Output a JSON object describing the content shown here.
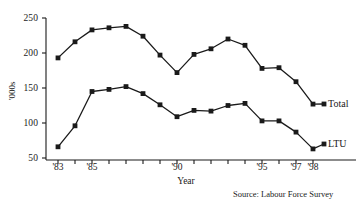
{
  "chart_data": {
    "type": "line",
    "title": "",
    "subtitle": "",
    "xlabel": "Year",
    "ylabel": "'000s",
    "x": [
      1983,
      1984,
      1985,
      1986,
      1987,
      1988,
      1989,
      1990,
      1991,
      1992,
      1993,
      1994,
      1995,
      1996,
      1997,
      1998
    ],
    "xtick_labels": [
      "'83",
      "'85",
      "'90",
      "'95",
      "'97",
      "'98"
    ],
    "xtick_values": [
      1983,
      1985,
      1990,
      1995,
      1997,
      1998
    ],
    "ytick_labels": [
      "50",
      "100",
      "150",
      "200",
      "250"
    ],
    "ytick_values": [
      50,
      100,
      150,
      200,
      250
    ],
    "xlim": [
      1983,
      1998
    ],
    "ylim": [
      50,
      250
    ],
    "grid": false,
    "legend_position": "right-inline",
    "marker": "square",
    "line_color": "#1a1a1a",
    "marker_color": "#1a1a1a",
    "series": [
      {
        "name": "Total",
        "label": "Total",
        "values": [
          193,
          216,
          233,
          236,
          238,
          224,
          197,
          172,
          198,
          206,
          220,
          211,
          178,
          179,
          159,
          127
        ]
      },
      {
        "name": "LTU",
        "label": "LTU",
        "values": [
          66,
          96,
          145,
          148,
          152,
          142,
          126,
          109,
          118,
          117,
          125,
          128,
          103,
          103,
          87,
          63
        ]
      }
    ],
    "annotations": [
      {
        "name": "source",
        "text": "Source: Labour Force Survey"
      }
    ]
  }
}
